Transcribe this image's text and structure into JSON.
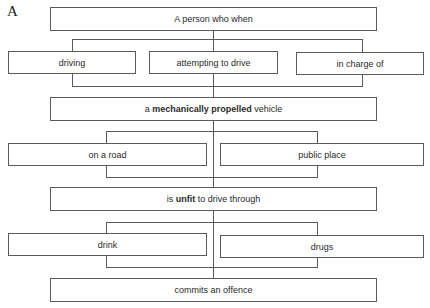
{
  "panel_label": "A",
  "nodes": {
    "person": {
      "text": "A person who when"
    },
    "driving": {
      "text": "driving"
    },
    "attempting": {
      "text": "attempting to drive"
    },
    "in_charge": {
      "text": "in charge of"
    },
    "vehicle": {
      "pre": "a ",
      "bold": "mechanically propelled",
      "post": " vehicle"
    },
    "road": {
      "text": "on a road"
    },
    "public_place": {
      "text": "public place"
    },
    "unfit": {
      "pre": "is ",
      "bold": "unfit",
      "post": " to drive through"
    },
    "drink": {
      "text": "drink"
    },
    "drugs": {
      "text": "drugs"
    },
    "offence": {
      "text": "commits an offence"
    }
  },
  "colors": {
    "line": "#5a5a5a",
    "text": "#2a2a2a",
    "background": "#ffffff"
  }
}
